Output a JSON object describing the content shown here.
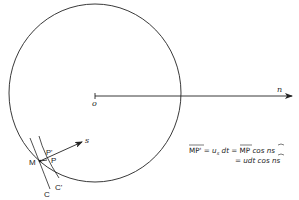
{
  "diagram": {
    "labels": {
      "origin": "o",
      "normal": "n",
      "direction": "s",
      "point_m": "M",
      "point_p": "P",
      "point_p_prime": "P'",
      "curve_c": "C",
      "curve_c_prime": "C'"
    },
    "equation": {
      "line1": "MP' = u_s dt = MP cos ns",
      "line1_parts": {
        "lhs": "MP'",
        "eq1": " = ",
        "u": "u",
        "sub": "s",
        "dt": " dt",
        "eq2": " = ",
        "mp": "MP",
        "cos": " cos  ",
        "angle": "ns"
      },
      "line2": "= udt cos ns",
      "line2_parts": {
        "eq": "= ",
        "udt": "udt cos  ",
        "angle": "ns"
      }
    },
    "colors": {
      "stroke": "#222222",
      "background": "#ffffff"
    }
  }
}
